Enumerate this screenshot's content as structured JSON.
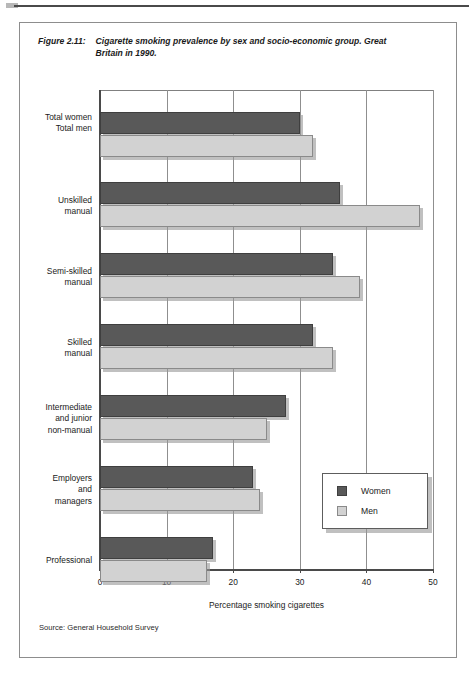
{
  "figure": {
    "number": "Figure 2.11:",
    "caption": "Cigarette smoking prevalence by sex and socio-economic group. Great Britain in 1990.",
    "source": "Source: General Household Survey"
  },
  "legend": {
    "position": "inside-right",
    "items": [
      {
        "label": "Women",
        "color": "#595959",
        "swatch": "women-swatch-icon"
      },
      {
        "label": "Men",
        "color": "#d2d2d2",
        "swatch": "men-swatch-icon"
      }
    ]
  },
  "axis": {
    "x_title": "Percentage smoking cigarettes",
    "x_ticks": [
      "0",
      "10",
      "20",
      "30",
      "40",
      "50"
    ]
  },
  "chart_data": {
    "type": "bar",
    "orientation": "horizontal",
    "title": "Cigarette smoking prevalence by sex and socio-economic group. Great Britain in 1990.",
    "xlabel": "Percentage smoking cigarettes",
    "ylabel": "",
    "xlim": [
      0,
      50
    ],
    "xticks": [
      0,
      10,
      20,
      30,
      40,
      50
    ],
    "grid": "vertical",
    "legend_position": "inside-right",
    "categories": [
      "Total women / Total men",
      "Unskilled manual",
      "Semi-skilled manual",
      "Skilled manual",
      "Intermediate and junior non-manual",
      "Employers and managers",
      "Professional"
    ],
    "series": [
      {
        "name": "Women",
        "color": "#595959",
        "values": [
          30,
          36,
          35,
          32,
          28,
          23,
          17
        ]
      },
      {
        "name": "Men",
        "color": "#d2d2d2",
        "values": [
          32,
          48,
          39,
          35,
          25,
          24,
          16
        ]
      }
    ],
    "groups": [
      {
        "label_lines": "Total women\nTotal men",
        "label_women": "Total women",
        "label_men": "Total men",
        "women": 30,
        "men": 32
      },
      {
        "label_lines": "Unskilled\nmanual",
        "women": 36,
        "men": 48
      },
      {
        "label_lines": "Semi-skilled\nmanual",
        "women": 35,
        "men": 39
      },
      {
        "label_lines": "Skilled\nmanual",
        "women": 32,
        "men": 35
      },
      {
        "label_lines": "Intermediate\nand junior\nnon-manual",
        "women": 28,
        "men": 25
      },
      {
        "label_lines": "Employers\nand\nmanagers",
        "women": 23,
        "men": 24
      },
      {
        "label_lines": "Professional",
        "women": 17,
        "men": 16
      }
    ]
  }
}
